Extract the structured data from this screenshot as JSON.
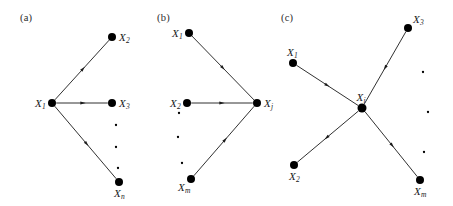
{
  "figure": {
    "type": "diagram",
    "background_color": "#ffffff",
    "stroke_color": "#1a1a1a",
    "node_color": "#000000",
    "panels": [
      {
        "id": "a",
        "label": "(a)",
        "hub": "X1",
        "hub_label_base": "X",
        "hub_label_sub": "1",
        "direction": "outgoing",
        "nodes": [
          {
            "id": "n_a_hub",
            "base": "X",
            "sub": "1",
            "x": 52,
            "y": 103,
            "r": 4.0,
            "label_side": "left"
          },
          {
            "id": "n_a_x2",
            "base": "X",
            "sub": "2",
            "x": 112,
            "y": 37,
            "r": 4.0,
            "label_side": "right"
          },
          {
            "id": "n_a_x3",
            "base": "X",
            "sub": "3",
            "x": 112,
            "y": 103,
            "r": 4.0,
            "label_side": "right"
          },
          {
            "id": "n_a_xn",
            "base": "X",
            "sub": "n",
            "x": 119,
            "y": 182,
            "r": 4.0,
            "label_side": "below"
          }
        ],
        "edges": [
          {
            "from": "n_a_hub",
            "to": "n_a_x2",
            "arrow_at": 0.52
          },
          {
            "from": "n_a_hub",
            "to": "n_a_x3",
            "arrow_at": 0.52
          },
          {
            "from": "n_a_hub",
            "to": "n_a_xn",
            "arrow_at": 0.52
          }
        ],
        "ellipsis": [
          {
            "x": 116,
            "y": 125
          },
          {
            "x": 116,
            "y": 147
          },
          {
            "x": 118,
            "y": 168
          }
        ]
      },
      {
        "id": "b",
        "label": "(b)",
        "hub": "Xj",
        "hub_label_base": "X",
        "hub_label_sub": "j",
        "direction": "incoming",
        "nodes": [
          {
            "id": "n_b_x1",
            "base": "X",
            "sub": "1",
            "x": 189,
            "y": 33,
            "r": 4.0,
            "label_side": "left"
          },
          {
            "id": "n_b_x2",
            "base": "X",
            "sub": "2",
            "x": 187,
            "y": 103,
            "r": 4.0,
            "label_side": "left"
          },
          {
            "id": "n_b_xm",
            "base": "X",
            "sub": "m",
            "x": 191,
            "y": 179,
            "r": 4.0,
            "label_side": "below-left"
          },
          {
            "id": "n_b_hub",
            "base": "X",
            "sub": "j",
            "x": 257,
            "y": 103,
            "r": 4.0,
            "label_side": "right"
          }
        ],
        "edges": [
          {
            "from": "n_b_x1",
            "to": "n_b_hub",
            "arrow_at": 0.5
          },
          {
            "from": "n_b_x2",
            "to": "n_b_hub",
            "arrow_at": 0.5
          },
          {
            "from": "n_b_xm",
            "to": "n_b_hub",
            "arrow_at": 0.52
          }
        ],
        "ellipsis": [
          {
            "x": 179,
            "y": 113
          },
          {
            "x": 178,
            "y": 137
          },
          {
            "x": 182,
            "y": 163
          }
        ]
      },
      {
        "id": "c",
        "label": "(c)",
        "hub": "Xi",
        "hub_label_base": "X",
        "hub_label_sub": "i",
        "direction": "mixed",
        "nodes": [
          {
            "id": "n_c_x1",
            "base": "X",
            "sub": "1",
            "x": 293,
            "y": 63,
            "r": 4.0,
            "label_side": "above"
          },
          {
            "id": "n_c_x2",
            "base": "X",
            "sub": "2",
            "x": 294,
            "y": 165,
            "r": 4.0,
            "label_side": "below"
          },
          {
            "id": "n_c_x3",
            "base": "X",
            "sub": "3",
            "x": 408,
            "y": 28,
            "r": 4.0,
            "label_side": "above-right"
          },
          {
            "id": "n_c_xm",
            "base": "X",
            "sub": "m",
            "x": 420,
            "y": 180,
            "r": 4.0,
            "label_side": "below"
          },
          {
            "id": "n_c_hub",
            "base": "X",
            "sub": "i",
            "x": 362,
            "y": 108,
            "r": 4.5,
            "label_side": "above"
          }
        ],
        "edges": [
          {
            "from": "n_c_x1",
            "to": "n_c_hub",
            "arrow_at": 0.5
          },
          {
            "from": "n_c_x3",
            "to": "n_c_hub",
            "arrow_at": 0.5
          },
          {
            "from": "n_c_hub",
            "to": "n_c_x2",
            "arrow_at": 0.52
          },
          {
            "from": "n_c_hub",
            "to": "n_c_xm",
            "arrow_at": 0.52
          }
        ],
        "ellipsis": [
          {
            "x": 423,
            "y": 72
          },
          {
            "x": 428,
            "y": 112
          },
          {
            "x": 424,
            "y": 152
          }
        ]
      }
    ],
    "panel_labels": [
      {
        "text": "(a)",
        "x": 20,
        "y": 12
      },
      {
        "text": "(b)",
        "x": 157,
        "y": 12
      },
      {
        "text": "(c)",
        "x": 281,
        "y": 12
      }
    ]
  }
}
